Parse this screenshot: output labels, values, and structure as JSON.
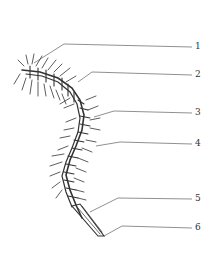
{
  "diagram": {
    "stroke_color": "#333333",
    "background": "#ffffff",
    "labels": [
      {
        "text": "1",
        "y": 47,
        "target": [
          34,
          63
        ]
      },
      {
        "text": "2",
        "y": 75,
        "target": [
          78,
          82
        ]
      },
      {
        "text": "3",
        "y": 113,
        "target": [
          94,
          117
        ]
      },
      {
        "text": "4",
        "y": 144,
        "target": [
          96,
          146
        ]
      },
      {
        "text": "5",
        "y": 199,
        "target": [
          90,
          212
        ]
      },
      {
        "text": "6",
        "y": 228,
        "target": [
          104,
          236
        ]
      }
    ]
  }
}
